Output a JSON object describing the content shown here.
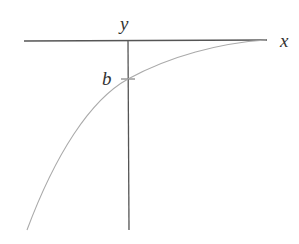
{
  "diagram": {
    "type": "function-graph",
    "labels": {
      "x_axis": "x",
      "y_axis": "y",
      "intercept": "b"
    },
    "colors": {
      "axes": "#555555",
      "curve": "#aaaaaa",
      "text": "#333333"
    }
  }
}
